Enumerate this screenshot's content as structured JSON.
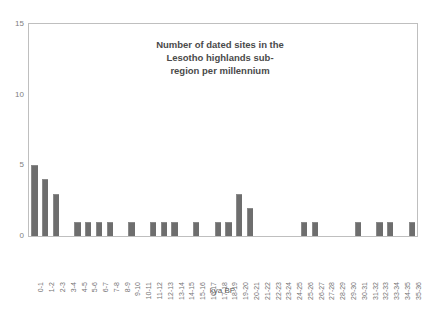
{
  "chart_data": {
    "type": "bar",
    "title_lines": [
      "Number of dated sites in the",
      "Lesotho highlands sub-",
      "region per millennium"
    ],
    "xlabel": "kya BP",
    "ylabel": "",
    "ylim": [
      0,
      15
    ],
    "yticks": [
      0,
      5,
      10,
      15
    ],
    "ytick_labels": [
      "0",
      "5",
      "10",
      "15"
    ],
    "grid": false,
    "legend": false,
    "bar_color": "#6e6e6e",
    "categories": [
      "0-1",
      "1-2",
      "2-3",
      "3-4",
      "4-5",
      "5-6",
      "6-7",
      "7-8",
      "8-9",
      "9-10",
      "10-11",
      "11-12",
      "12-13",
      "13-14",
      "14-15",
      "15-16",
      "16-17",
      "17-18",
      "18-19",
      "19-20",
      "20-21",
      "21-22",
      "22-23",
      "23-24",
      "24-25",
      "25-26",
      "26-27",
      "27-28",
      "28-29",
      "29-30",
      "30-31",
      "31-32",
      "32-33",
      "33-34",
      "34-35",
      "35-36"
    ],
    "values": [
      5,
      4,
      3,
      0,
      1,
      1,
      1,
      1,
      0,
      1,
      0,
      1,
      1,
      1,
      0,
      1,
      0,
      1,
      1,
      3,
      2,
      0,
      0,
      0,
      0,
      1,
      1,
      0,
      0,
      0,
      1,
      0,
      1,
      1,
      0,
      1
    ]
  }
}
